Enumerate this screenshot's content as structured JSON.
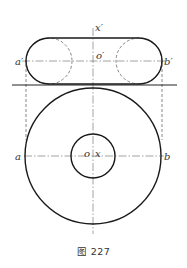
{
  "figure": {
    "caption": "图 227"
  },
  "labels": {
    "front_axis": "x′",
    "front_center": "o′",
    "front_left_point": "a′",
    "front_right_point": "b′",
    "top_center": "o",
    "top_axis": "x",
    "top_left_point": "a",
    "top_right_point": "b"
  },
  "geometry": {
    "axis_x": 93,
    "front_view": {
      "top_y": 38,
      "bottom_y": 84,
      "center_y": 61,
      "left_x": 26,
      "right_x": 162,
      "radius": 23,
      "left_circle_cx": 49,
      "right_circle_cx": 139
    },
    "ground_line": {
      "y": 85,
      "x1": 12,
      "x2": 177
    },
    "top_view": {
      "cx": 93,
      "cy": 156,
      "outer_radius": 68,
      "inner_radius": 22
    }
  },
  "colors": {
    "stroke": "#1a1a1a",
    "text": "#333333",
    "background": "#ffffff"
  }
}
